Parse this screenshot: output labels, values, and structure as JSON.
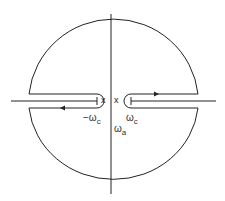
{
  "diagram": {
    "type": "contour-integration-diagram",
    "colors": {
      "stroke": "#222222",
      "text": "#333333",
      "background": "#ffffff"
    },
    "markers": {
      "left_pole": "x",
      "right_pole": "x"
    },
    "labels": {
      "neg_omega_c": {
        "prefix": "−ω",
        "sub": "c"
      },
      "omega_c": {
        "prefix": "ω",
        "sub": "c"
      },
      "omega_a": {
        "prefix": "ω",
        "sub": "a"
      }
    },
    "arrows": [
      {
        "name": "left-branch-arrow",
        "direction": "left"
      },
      {
        "name": "right-branch-arrow",
        "direction": "right"
      }
    ]
  }
}
